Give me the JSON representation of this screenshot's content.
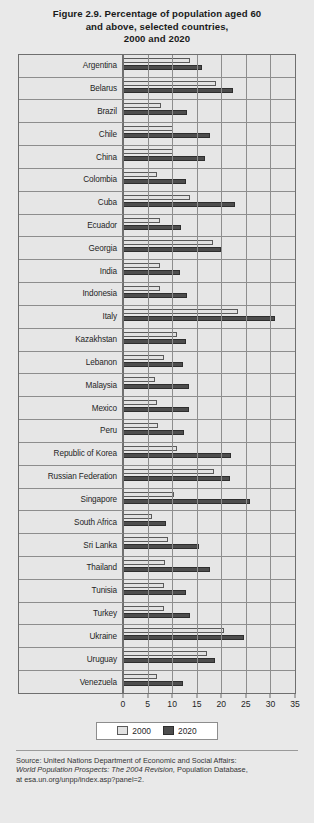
{
  "figure": {
    "title_line1": "Figure 2.9.  Percentage of population aged 60",
    "title_line2": "and above, selected countries,",
    "title_line3": "2000 and 2020"
  },
  "legend": {
    "items": [
      {
        "label": "2000",
        "color": "#e2e2e2"
      },
      {
        "label": "2020",
        "color": "#4d4d4d"
      }
    ]
  },
  "source": {
    "line1": "Source: United Nations Department of Economic and Social Affairs:",
    "line2_italic": "World Population Prospects: The 2004 Revision,",
    "line2_rest": " Population Database,",
    "line3": "at esa.un.org/unpp/index.asp?panel=2."
  },
  "chart_data": {
    "type": "bar",
    "orientation": "horizontal",
    "title": "Figure 2.9. Percentage of population aged 60 and above, selected countries, 2000 and 2020",
    "xlabel": "",
    "ylabel": "",
    "xlim": [
      0,
      35
    ],
    "xticks": [
      0,
      5,
      10,
      15,
      20,
      25,
      30,
      35
    ],
    "grid": true,
    "legend_position": "bottom-center",
    "categories": [
      "Argentina",
      "Belarus",
      "Brazil",
      "Chile",
      "China",
      "Colombia",
      "Cuba",
      "Ecuador",
      "Georgia",
      "India",
      "Indonesia",
      "Italy",
      "Kazakhstan",
      "Lebanon",
      "Malaysia",
      "Mexico",
      "Peru",
      "Republic of Korea",
      "Russian Federation",
      "Singapore",
      "South Africa",
      "Sri Lanka",
      "Thailand",
      "Tunisia",
      "Turkey",
      "Ukraine",
      "Uruguay",
      "Venezuela"
    ],
    "series": [
      {
        "name": "2000",
        "color": "#e2e2e2",
        "values": [
          13.6,
          18.9,
          7.8,
          10.2,
          10.1,
          6.9,
          13.7,
          7.6,
          18.4,
          7.6,
          7.6,
          23.3,
          10.9,
          8.3,
          6.6,
          6.9,
          7.2,
          11.0,
          18.5,
          10.3,
          6.0,
          9.2,
          8.6,
          8.3,
          8.4,
          20.6,
          17.1,
          7.0
        ]
      },
      {
        "name": "2020",
        "color": "#4d4d4d",
        "values": [
          16.1,
          22.3,
          13.1,
          17.7,
          16.6,
          12.8,
          22.8,
          11.9,
          20.0,
          11.5,
          13.0,
          30.9,
          12.8,
          12.3,
          13.4,
          13.4,
          12.4,
          22.0,
          21.8,
          25.8,
          8.7,
          15.4,
          17.7,
          12.9,
          13.7,
          24.7,
          18.7,
          12.2
        ]
      }
    ]
  }
}
